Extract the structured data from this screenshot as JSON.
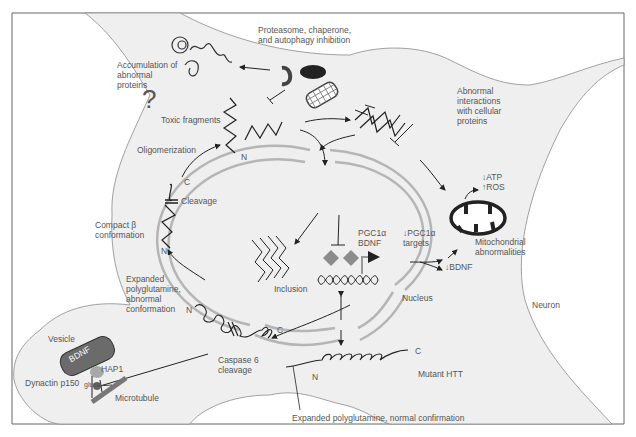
{
  "colors": {
    "cell_fill": "#efefef",
    "outline": "#8a8a8a",
    "nucleus_ring": "#b5b5b5",
    "ink": "#222222",
    "bdnf_vesicle": "#6b6b6b",
    "hap1": "#a8a8a8",
    "diamond": "#8c8c8c"
  },
  "labels": {
    "proteasome": "Proteasome, chaperone,",
    "proteasome2": "and autophagy inhibition",
    "accumulation1": "Accumulation of",
    "accumulation2": "abnormal",
    "accumulation3": "proteins",
    "toxic_fragments": "Toxic fragments",
    "oligomerization": "Oligomerization",
    "abnormal1": "Abnormal",
    "abnormal2": "interactions",
    "abnormal3": "with cellular",
    "abnormal4": "proteins",
    "question": "?",
    "atp": "↓ATP",
    "ros": "↑ROS",
    "cleavage": "Cleavage",
    "compact1": "Compact β",
    "compact2": "conformation",
    "expanded1": "Expanded",
    "expanded2": "polyglutamine,",
    "expanded3": "abnormal",
    "expanded4": "conformation",
    "inclusion": "Inclusion",
    "pgc_bdnf1": "PGC1α",
    "pgc_bdnf2": "BDNF",
    "pgc_targets1": "↓PGC1α",
    "pgc_targets2": "targets",
    "bdnf_down": "↓BDNF",
    "mito1": "Mitochondrial",
    "mito2": "abnormalities",
    "nucleus": "Nucleus",
    "neuron": "Neuron",
    "vesicle": "Vesicle",
    "bdnf": "BDNF",
    "hap1": "HAP1",
    "dynactin": "Dynactin p150",
    "glued": "glued",
    "microtubule": "Microtubule",
    "caspase1": "Caspase 6",
    "caspase2": "cleavage",
    "mutant_htt": "Mutant HTT",
    "expanded_normal": "Expanded polyglutamine, normal confirmation",
    "n": "N",
    "c": "C"
  }
}
